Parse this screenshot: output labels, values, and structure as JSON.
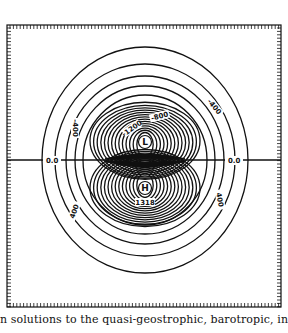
{
  "figure": {
    "frame": {
      "x": 7,
      "y": 25,
      "width": 274,
      "height": 282
    },
    "zero_line_y": 160,
    "zero_labels": [
      {
        "text": "0.0",
        "x": 46,
        "y": 163
      },
      {
        "text": "0.0",
        "x": 228,
        "y": 163
      }
    ],
    "centers": [
      {
        "text": "L",
        "x": 145,
        "y": 142
      },
      {
        "text": "H",
        "x": 145,
        "y": 188
      }
    ],
    "contour_labels": [
      {
        "text": "-400",
        "x": 73,
        "y": 128,
        "rotate": 90
      },
      {
        "text": "-1200",
        "x": 133,
        "y": 130,
        "rotate": -35
      },
      {
        "text": "-800",
        "x": 160,
        "y": 118,
        "rotate": -15
      },
      {
        "text": "-400",
        "x": 213,
        "y": 108,
        "rotate": 50
      },
      {
        "text": "400",
        "x": 76,
        "y": 212,
        "rotate": -70
      },
      {
        "text": "400",
        "x": 218,
        "y": 200,
        "rotate": 80
      },
      {
        "text": "1318",
        "x": 145,
        "y": 204,
        "rotate": 0
      }
    ],
    "line_color": "#111111"
  },
  "caption": {
    "text": "n solutions to the quasi-geostrophic, barotropic, infinite"
  }
}
